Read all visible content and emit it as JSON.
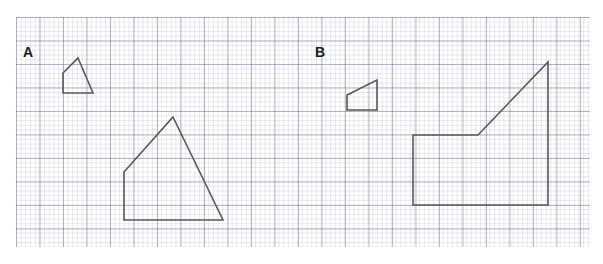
{
  "worksheet": {
    "width": 603,
    "height": 264,
    "background_color": "#ffffff",
    "stroke_color": "#575757",
    "grid": {
      "type": "graph-paper",
      "major_cell_px": 23.5,
      "minor_cell_px": 4.7,
      "major_line_color": "#5a5a7d",
      "minor_line_color": "#7878963",
      "origin_x": 16,
      "origin_y": 17,
      "width": 574,
      "height": 230
    }
  },
  "panels": [
    {
      "id": "panel-a",
      "label": "A",
      "label_x": 23,
      "label_y": 45,
      "shapes": [
        {
          "id": "shape-a-small",
          "name": "small-pentagon-house",
          "role": "original",
          "points": "78,58 93,93 63,93 63,73",
          "vertices": [
            [
              78,
              58
            ],
            [
              93,
              93
            ],
            [
              63,
              93
            ],
            [
              63,
              73
            ]
          ]
        },
        {
          "id": "shape-a-large",
          "name": "large-pentagon-house",
          "role": "scaled-copy",
          "points": "173,117 223,220 124,220 124,172",
          "vertices": [
            [
              173,
              117
            ],
            [
              223,
              220
            ],
            [
              124,
              220
            ],
            [
              124,
              172
            ]
          ]
        }
      ]
    },
    {
      "id": "panel-b",
      "label": "B",
      "label_x": 315,
      "label_y": 45,
      "shapes": [
        {
          "id": "shape-b-small",
          "name": "small-ramp-quadrilateral",
          "role": "original",
          "points": "377,80 377,110 347,110 347,95",
          "vertices": [
            [
              377,
              80
            ],
            [
              377,
              110
            ],
            [
              347,
              110
            ],
            [
              347,
              95
            ]
          ]
        },
        {
          "id": "shape-b-large",
          "name": "large-ramp-quadrilateral",
          "role": "scaled-copy",
          "points": "548,62 548,205 413,205 413,135 478,135",
          "vertices": [
            [
              548,
              62
            ],
            [
              548,
              205
            ],
            [
              413,
              205
            ],
            [
              413,
              135
            ],
            [
              478,
              135
            ]
          ]
        }
      ]
    }
  ]
}
